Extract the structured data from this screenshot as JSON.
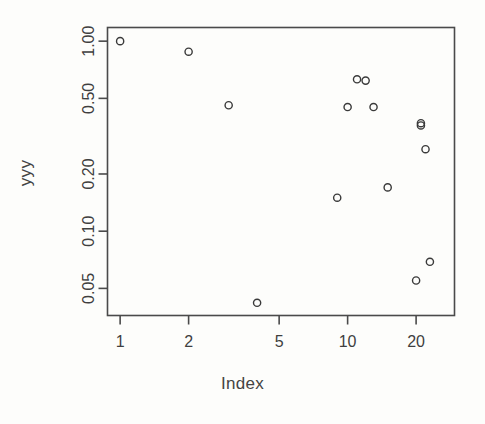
{
  "chart_data": {
    "type": "scatter",
    "title": "",
    "xlabel": "Index",
    "ylabel": "yyy",
    "xscale": "log",
    "yscale": "log",
    "xlim": [
      0.88,
      29.5
    ],
    "ylim": [
      0.036,
      1.18
    ],
    "grid": false,
    "legend": null,
    "xticks": [
      1,
      2,
      5,
      10,
      20
    ],
    "xticklabels": [
      "1",
      "2",
      "5",
      "10",
      "20"
    ],
    "yticks": [
      0.05,
      0.1,
      0.2,
      0.5,
      1.0
    ],
    "yticklabels": [
      "0.05",
      "0.10",
      "0.20",
      "0.50",
      "1.00"
    ],
    "marker": "open-circle",
    "marker_color": "#3a3a3a",
    "x": [
      1,
      2,
      3,
      4,
      9,
      10,
      11,
      12,
      13,
      15,
      20,
      21,
      21,
      22,
      23
    ],
    "y": [
      1.0,
      0.88,
      0.46,
      0.042,
      0.15,
      0.45,
      0.63,
      0.62,
      0.45,
      0.17,
      0.055,
      0.36,
      0.37,
      0.27,
      0.069
    ],
    "points": [
      {
        "x": 1,
        "y": 1.0
      },
      {
        "x": 2,
        "y": 0.88
      },
      {
        "x": 3,
        "y": 0.46
      },
      {
        "x": 4,
        "y": 0.042
      },
      {
        "x": 9,
        "y": 0.15
      },
      {
        "x": 10,
        "y": 0.45
      },
      {
        "x": 11,
        "y": 0.63
      },
      {
        "x": 12,
        "y": 0.62
      },
      {
        "x": 13,
        "y": 0.45
      },
      {
        "x": 15,
        "y": 0.17
      },
      {
        "x": 20,
        "y": 0.055
      },
      {
        "x": 21,
        "y": 0.36
      },
      {
        "x": 21,
        "y": 0.37
      },
      {
        "x": 22,
        "y": 0.27
      },
      {
        "x": 23,
        "y": 0.069
      }
    ]
  },
  "axes": {
    "x_title": "Index",
    "y_title": "yyy"
  }
}
